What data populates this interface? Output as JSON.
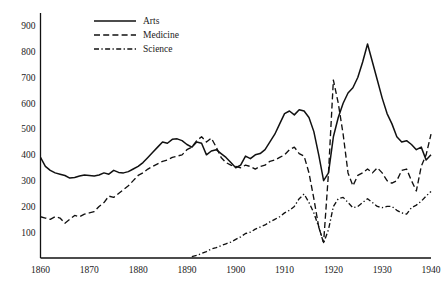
{
  "chart_data": {
    "type": "line",
    "title": "",
    "subtitle": "",
    "xlabel": "",
    "ylabel": "",
    "xlim": [
      1860,
      1940
    ],
    "ylim": [
      0,
      950
    ],
    "grid": false,
    "legend_position": "top-left",
    "x_ticks": [
      1860,
      1870,
      1880,
      1890,
      1900,
      1910,
      1920,
      1930,
      1940
    ],
    "x_tick_labels": [
      "1860",
      "1870",
      "1880",
      "1890",
      "1900",
      "1910",
      "1920",
      "1930",
      "1940"
    ],
    "y_ticks": [
      100,
      200,
      300,
      400,
      500,
      600,
      700,
      800,
      900
    ],
    "y_tick_labels": [
      "100",
      "200",
      "300",
      "400",
      "500",
      "600",
      "700",
      "800",
      "900"
    ],
    "series": [
      {
        "name": "Arts",
        "style": "solid",
        "color": "#111111",
        "x": [
          1860,
          1861,
          1862,
          1863,
          1864,
          1865,
          1866,
          1867,
          1868,
          1869,
          1870,
          1871,
          1872,
          1873,
          1874,
          1875,
          1876,
          1877,
          1878,
          1879,
          1880,
          1881,
          1882,
          1883,
          1884,
          1885,
          1886,
          1887,
          1888,
          1889,
          1890,
          1891,
          1892,
          1893,
          1894,
          1895,
          1896,
          1897,
          1898,
          1899,
          1900,
          1901,
          1902,
          1903,
          1904,
          1905,
          1906,
          1907,
          1908,
          1909,
          1910,
          1911,
          1912,
          1913,
          1914,
          1915,
          1916,
          1917,
          1918,
          1919,
          1920,
          1921,
          1922,
          1923,
          1924,
          1925,
          1926,
          1927,
          1928,
          1929,
          1930,
          1931,
          1932,
          1933,
          1934,
          1935,
          1936,
          1937,
          1938,
          1939,
          1940
        ],
        "values": [
          390,
          355,
          340,
          330,
          325,
          320,
          310,
          312,
          318,
          322,
          320,
          318,
          322,
          330,
          325,
          340,
          332,
          330,
          335,
          345,
          355,
          370,
          390,
          410,
          430,
          450,
          445,
          460,
          462,
          455,
          440,
          430,
          450,
          445,
          400,
          415,
          420,
          405,
          390,
          370,
          350,
          360,
          395,
          385,
          400,
          405,
          420,
          450,
          480,
          520,
          560,
          570,
          555,
          575,
          570,
          545,
          490,
          400,
          300,
          330,
          470,
          545,
          600,
          640,
          660,
          700,
          760,
          830,
          760,
          690,
          620,
          560,
          520,
          470,
          450,
          455,
          440,
          420,
          430,
          380,
          400
        ]
      },
      {
        "name": "Medicine",
        "style": "dashed",
        "color": "#111111",
        "x": [
          1860,
          1861,
          1862,
          1863,
          1864,
          1865,
          1866,
          1867,
          1868,
          1869,
          1870,
          1871,
          1872,
          1873,
          1874,
          1875,
          1876,
          1877,
          1878,
          1879,
          1880,
          1881,
          1882,
          1883,
          1884,
          1885,
          1886,
          1887,
          1888,
          1889,
          1890,
          1891,
          1892,
          1893,
          1894,
          1895,
          1896,
          1897,
          1898,
          1899,
          1900,
          1901,
          1902,
          1903,
          1904,
          1905,
          1906,
          1907,
          1908,
          1909,
          1910,
          1911,
          1912,
          1913,
          1914,
          1915,
          1916,
          1917,
          1918,
          1919,
          1920,
          1921,
          1922,
          1923,
          1924,
          1925,
          1926,
          1927,
          1928,
          1929,
          1930,
          1931,
          1932,
          1933,
          1934,
          1935,
          1936,
          1937,
          1938,
          1939,
          1940
        ],
        "values": [
          160,
          155,
          150,
          160,
          155,
          135,
          150,
          165,
          160,
          170,
          175,
          180,
          200,
          215,
          240,
          235,
          250,
          265,
          280,
          300,
          320,
          330,
          345,
          355,
          365,
          375,
          380,
          390,
          395,
          400,
          420,
          430,
          455,
          470,
          450,
          465,
          430,
          390,
          370,
          360,
          355,
          350,
          360,
          355,
          345,
          355,
          360,
          375,
          380,
          390,
          400,
          420,
          430,
          405,
          395,
          330,
          230,
          120,
          60,
          330,
          690,
          600,
          480,
          330,
          280,
          320,
          330,
          345,
          330,
          350,
          330,
          300,
          290,
          300,
          340,
          345,
          300,
          260,
          355,
          400,
          480
        ]
      },
      {
        "name": "Science",
        "style": "dashdot",
        "color": "#111111",
        "x": [
          1891,
          1892,
          1893,
          1894,
          1895,
          1896,
          1897,
          1898,
          1899,
          1900,
          1901,
          1902,
          1903,
          1904,
          1905,
          1906,
          1907,
          1908,
          1909,
          1910,
          1911,
          1912,
          1913,
          1914,
          1915,
          1916,
          1917,
          1918,
          1919,
          1920,
          1921,
          1922,
          1923,
          1924,
          1925,
          1926,
          1927,
          1928,
          1929,
          1930,
          1931,
          1932,
          1933,
          1934,
          1935,
          1936,
          1937,
          1938,
          1939,
          1940
        ],
        "values": [
          5,
          10,
          18,
          25,
          35,
          40,
          48,
          55,
          62,
          72,
          82,
          95,
          100,
          112,
          120,
          128,
          140,
          150,
          160,
          175,
          185,
          200,
          230,
          248,
          215,
          175,
          120,
          58,
          110,
          200,
          230,
          235,
          215,
          195,
          200,
          215,
          230,
          215,
          200,
          195,
          200,
          200,
          185,
          175,
          170,
          195,
          205,
          220,
          240,
          258
        ]
      }
    ]
  },
  "legend": {
    "items": [
      {
        "label": "Arts",
        "style": "solid"
      },
      {
        "label": "Medicine",
        "style": "dashed"
      },
      {
        "label": "Science",
        "style": "dashdot"
      }
    ]
  }
}
